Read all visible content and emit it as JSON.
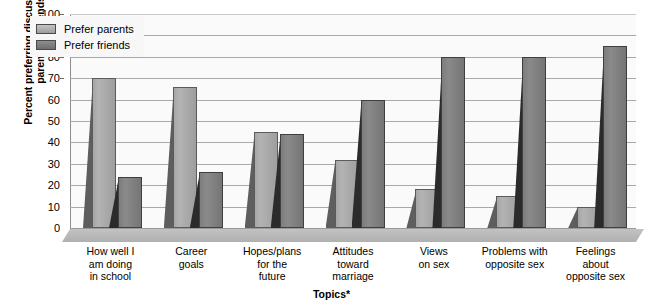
{
  "chart_data": {
    "type": "bar",
    "title": "",
    "xlabel": "Topics*",
    "ylabel": "Percent preferring discussion with parents or friends",
    "ylabel_lines": [
      "Percent preferring discussion with",
      "parents or friends"
    ],
    "ylim": [
      0,
      100
    ],
    "yticks": [
      0,
      10,
      20,
      30,
      40,
      50,
      60,
      70,
      80,
      90,
      100
    ],
    "grid": true,
    "legend_position": "top-left",
    "categories": [
      "How well I am doing in school",
      "Career goals",
      "Hopes/plans for the future",
      "Attitudes toward marriage",
      "Views on sex",
      "Problems with opposite sex",
      "Feelings about opposite sex"
    ],
    "category_lines": [
      [
        "How well I",
        "am doing",
        "in school"
      ],
      [
        "Career",
        "goals"
      ],
      [
        "Hopes/plans",
        "for the",
        "future"
      ],
      [
        "Attitudes",
        "toward",
        "marriage"
      ],
      [
        "Views",
        "on sex"
      ],
      [
        "Problems with",
        "opposite sex"
      ],
      [
        "Feelings",
        "about",
        "opposite sex"
      ]
    ],
    "series": [
      {
        "name": "Prefer parents",
        "color": "#a8a8a8",
        "values": [
          70,
          66,
          45,
          32,
          18,
          15,
          10
        ]
      },
      {
        "name": "Prefer friends",
        "color": "#7a7a7a",
        "values": [
          24,
          26,
          44,
          60,
          80,
          80,
          85
        ]
      }
    ]
  },
  "legend": {
    "items": [
      {
        "label": "Prefer parents"
      },
      {
        "label": "Prefer friends"
      }
    ]
  }
}
